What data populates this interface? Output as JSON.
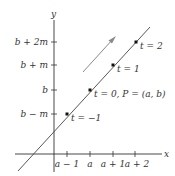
{
  "diagram": {
    "type": "parametric-line",
    "colors": {
      "axis": "#333333",
      "line": "#444444",
      "arrow": "#8a8a8a",
      "point": "#111111",
      "text": "#333333"
    },
    "axes": {
      "x_label": "x",
      "y_label": "y",
      "x_ticks": [
        "a − 1",
        "a",
        "a + 1",
        "a + 2"
      ],
      "y_ticks": [
        "b + 2m",
        "b + m",
        "b",
        "b − m"
      ]
    },
    "points": [
      {
        "label": "t = −1"
      },
      {
        "label": "t = 0, P = (a, b)"
      },
      {
        "label": "t = 1"
      },
      {
        "label": "t = 2"
      }
    ],
    "direction_arrow": "direction-of-increasing-t"
  }
}
